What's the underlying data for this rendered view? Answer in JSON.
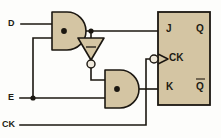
{
  "diagram": {
    "type": "logic-circuit-schematic",
    "colors": {
      "gate_fill": "#d4c5a3",
      "line": "#1b1711",
      "background": "#fdfdfb",
      "bubble_fill": "#efe9dc"
    }
  },
  "inputs": [
    {
      "id": "d",
      "label": "D"
    },
    {
      "id": "e",
      "label": "E"
    },
    {
      "id": "ck",
      "label": "CK"
    }
  ],
  "gates": [
    {
      "id": "and-top",
      "type": "and",
      "symbol": "·",
      "inputs": [
        "D",
        "E"
      ],
      "output": "J"
    },
    {
      "id": "inverter",
      "type": "not",
      "symbol": "−",
      "inputs": [
        "and-top"
      ],
      "output": "and-bottom"
    },
    {
      "id": "and-bottom",
      "type": "and",
      "symbol": "·",
      "inputs": [
        "inverter",
        "E"
      ],
      "output": "K"
    }
  ],
  "flipflop": {
    "id": "jk-flipflop",
    "kind": "JK",
    "pins": {
      "j": "J",
      "k": "K",
      "clock": "CK",
      "q": "Q",
      "q_not": "Q",
      "q_not_overbar": true
    },
    "clock_inverted": true,
    "clock_edge_triggered": true
  },
  "junctions": [
    {
      "id": "j-and-top-out",
      "on": "and-top output to J and inverter"
    },
    {
      "id": "j-e-branch",
      "on": "E line to both AND gates"
    }
  ]
}
